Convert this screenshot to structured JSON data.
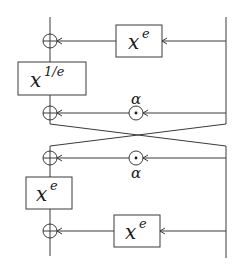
{
  "diagram": {
    "title": "",
    "colors": {
      "stroke": "#3a3a3a",
      "text": "#1a1a1a",
      "background": "#ffffff"
    },
    "boxes": [
      {
        "id": "box-top",
        "base": "x",
        "exp": "e"
      },
      {
        "id": "box-inverse",
        "base": "x",
        "exp": "1/e"
      },
      {
        "id": "box-middle",
        "base": "x",
        "exp": "e"
      },
      {
        "id": "box-bottom",
        "base": "x",
        "exp": "e"
      }
    ],
    "operators": [
      {
        "id": "xor-1",
        "symbol": "⊕"
      },
      {
        "id": "xor-2",
        "symbol": "⊕"
      },
      {
        "id": "odot-1",
        "symbol": "⊙",
        "label": "α"
      },
      {
        "id": "xor-3",
        "symbol": "⊕"
      },
      {
        "id": "odot-2",
        "symbol": "⊙",
        "label": "α"
      },
      {
        "id": "xor-4",
        "symbol": "⊕"
      }
    ],
    "labels": {
      "alpha_top": "α",
      "alpha_bottom": "α"
    }
  }
}
